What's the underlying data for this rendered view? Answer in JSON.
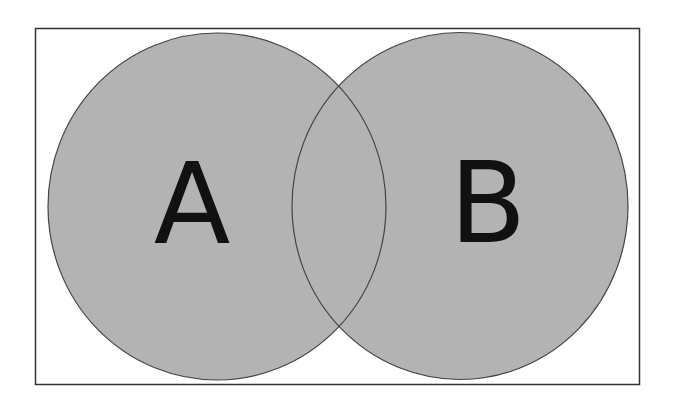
{
  "diagram": {
    "type": "venn",
    "sets": [
      {
        "id": "A",
        "label": "A"
      },
      {
        "id": "B",
        "label": "B"
      }
    ],
    "intersections": [
      {
        "sets": [
          "A",
          "B"
        ],
        "label": ""
      }
    ],
    "colors": {
      "circle_fill": "#b3b3b3",
      "circle_stroke": "#444444",
      "frame_stroke": "#333333",
      "label_color": "#111111",
      "background": "#ffffff"
    }
  }
}
